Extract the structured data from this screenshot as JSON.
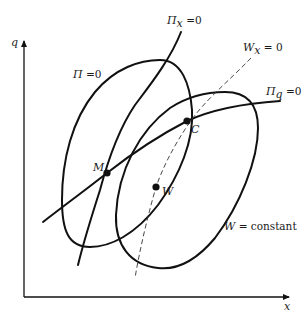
{
  "diagram": {
    "type": "economics-contour-diagram",
    "axes": {
      "y_label": "q",
      "x_label": "x"
    },
    "curves": [
      {
        "id": "pi-zero",
        "label": "Π = 0",
        "label_main": "Π",
        "label_rest": " =0",
        "style": "solid-closed"
      },
      {
        "id": "w-constant",
        "label": "W = constant",
        "label_main": "W",
        "label_rest": " = constant",
        "style": "solid-closed"
      },
      {
        "id": "pi-x-zero",
        "label": "Πx = 0",
        "label_main": "Π",
        "label_sub": "x",
        "label_rest": " =0",
        "style": "solid"
      },
      {
        "id": "pi-q-zero",
        "label": "Πq = 0",
        "label_main": "Π",
        "label_sub": "q",
        "label_rest": " =0",
        "style": "solid"
      },
      {
        "id": "w-x-zero",
        "label": "Wx = 0",
        "label_main": "W",
        "label_sub": "x",
        "label_rest": " = 0",
        "style": "dashed"
      }
    ],
    "points": [
      {
        "id": "M",
        "label": "M"
      },
      {
        "id": "C",
        "label": "C"
      },
      {
        "id": "W",
        "label": "W"
      }
    ]
  }
}
